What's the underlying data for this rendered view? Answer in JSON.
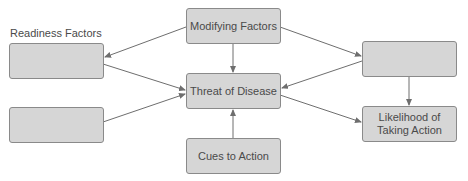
{
  "diagram": {
    "readiness_label": "Readiness Factors",
    "nodes": {
      "modifying": "Modifying Factors",
      "threat": "Threat of Disease",
      "cues": "Cues to Action",
      "likelihood_line1": "Likelihood of",
      "likelihood_line2": "Taking Action",
      "readiness_top": "",
      "readiness_bottom": "",
      "right_top": ""
    },
    "edges": [
      {
        "from": "modifying",
        "to": "readiness_top"
      },
      {
        "from": "modifying",
        "to": "threat"
      },
      {
        "from": "modifying",
        "to": "right_top"
      },
      {
        "from": "readiness_top",
        "to": "threat"
      },
      {
        "from": "readiness_bottom",
        "to": "threat"
      },
      {
        "from": "cues",
        "to": "threat"
      },
      {
        "from": "right_top",
        "to": "threat"
      },
      {
        "from": "right_top",
        "to": "likelihood"
      },
      {
        "from": "threat",
        "to": "likelihood"
      }
    ],
    "colors": {
      "box_fill": "#d6d6d6",
      "box_border": "#8a8a8a",
      "text": "#4a4a4a",
      "edge": "#6e6e6e"
    }
  }
}
